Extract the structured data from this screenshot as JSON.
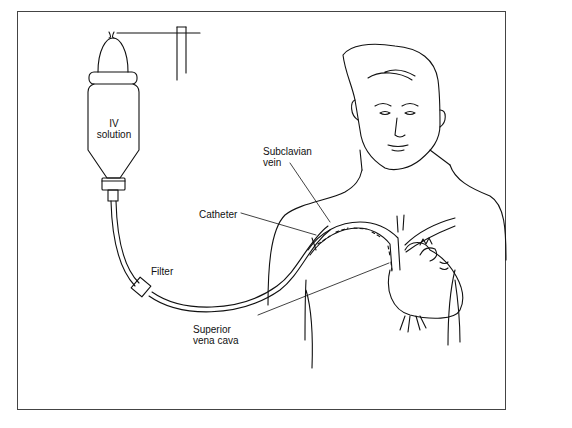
{
  "figure": {
    "type": "medical-illustration"
  },
  "labels": {
    "iv_solution_line1": "IV",
    "iv_solution_line2": "solution",
    "catheter": "Catheter",
    "filter": "Filter",
    "subclavian_line1": "Subclavian",
    "subclavian_line2": "vein",
    "svc_line1": "Superior",
    "svc_line2": "vena cava"
  },
  "colors": {
    "line": "#111111",
    "background": "#ffffff",
    "frame": "#444444"
  }
}
